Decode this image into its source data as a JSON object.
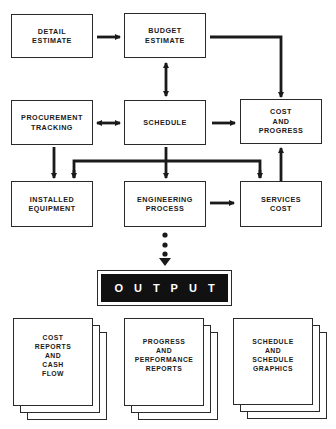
{
  "diagram": {
    "type": "flowchart",
    "nodes": {
      "detail_estimate": "DETAIL\nESTIMATE",
      "budget_estimate": "BUDGET\nESTIMATE",
      "procurement_tracking": "PROCUREMENT\nTRACKING",
      "schedule": "SCHEDULE",
      "cost_and_progress": "COST\nAND\nPROGRESS",
      "installed_equipment": "INSTALLED\nEQUIPMENT",
      "engineering_process": "ENGINEERING\nPROCESS",
      "services_cost": "SERVICES\nCOST"
    },
    "output_label": "OUTPUT",
    "outputs": [
      "COST\nREPORTS\nAND\nCASH\nFLOW",
      "PROGRESS\nAND\nPERFORMANCE\nREPORTS",
      "SCHEDULE\nAND\nSCHEDULE\nGRAPHICS"
    ],
    "edges": [
      {
        "from": "DETAIL ESTIMATE",
        "to": "BUDGET ESTIMATE",
        "type": "arrow"
      },
      {
        "from": "BUDGET ESTIMATE",
        "to": "COST AND PROGRESS",
        "type": "arrow"
      },
      {
        "from": "BUDGET ESTIMATE",
        "to": "SCHEDULE",
        "type": "bidirectional"
      },
      {
        "from": "PROCUREMENT TRACKING",
        "to": "SCHEDULE",
        "type": "bidirectional"
      },
      {
        "from": "SCHEDULE",
        "to": "COST AND PROGRESS",
        "type": "arrow"
      },
      {
        "from": "PROCUREMENT TRACKING",
        "to": "INSTALLED EQUIPMENT",
        "type": "arrow"
      },
      {
        "from": "SCHEDULE",
        "to": "ENGINEERING PROCESS",
        "type": "arrow"
      },
      {
        "from": "SCHEDULE",
        "to": "INSTALLED EQUIPMENT",
        "type": "arrow"
      },
      {
        "from": "SCHEDULE",
        "to": "SERVICES COST",
        "type": "arrow"
      },
      {
        "from": "ENGINEERING PROCESS",
        "to": "SERVICES COST",
        "type": "arrow"
      },
      {
        "from": "SERVICES COST",
        "to": "COST AND PROGRESS",
        "type": "arrow"
      },
      {
        "from": "ENGINEERING PROCESS",
        "to": "OUTPUT",
        "type": "dotted-arrow"
      }
    ],
    "colors": {
      "stroke": "#1a1a1a",
      "output_fill": "#111111",
      "output_text": "#ffffff"
    }
  }
}
